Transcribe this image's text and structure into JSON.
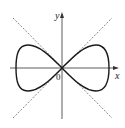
{
  "figure": {
    "type": "curve-plot",
    "labels": {
      "x_axis": "x",
      "y_axis": "y",
      "origin": "0"
    },
    "colors": {
      "curve": "#1a1a1a",
      "axes": "#333333",
      "dashed_lines": "#555555",
      "background": "#ffffff"
    },
    "geometry": {
      "origin_px": [
        62,
        68
      ],
      "x_axis_px": [
        10,
        118
      ],
      "y_axis_px": [
        118,
        12
      ],
      "lobe_half_width_px": 45,
      "lobe_half_height_px": 23,
      "dashed_lines": [
        {
          "from": [
            13,
            18
          ],
          "to": [
            112,
            118
          ]
        },
        {
          "from": [
            13,
            118
          ],
          "to": [
            112,
            18
          ]
        }
      ]
    }
  }
}
